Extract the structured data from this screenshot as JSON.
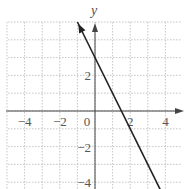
{
  "chart_data": {
    "type": "line",
    "title": "",
    "xlabel": "",
    "ylabel": "y",
    "xlim": [
      -5,
      5
    ],
    "ylim": [
      -5,
      5
    ],
    "grid": true,
    "grid_step": 1,
    "x_ticks": [
      -4,
      -2,
      0,
      2,
      4
    ],
    "y_ticks": [
      -4,
      -2,
      2
    ],
    "x_tick_labels": [
      "−4",
      "−2",
      "0",
      "2",
      "4"
    ],
    "y_tick_labels": [
      "−4",
      "−2",
      "2"
    ],
    "series": [
      {
        "name": "y = -2x + 3",
        "slope": -2,
        "intercept": 3,
        "x": [
          -1,
          3.8
        ],
        "y": [
          5,
          -4.6
        ],
        "arrow_start": true,
        "arrow_end": false,
        "color": "#222222"
      }
    ],
    "key_points": {
      "y_intercept": [
        0,
        3
      ],
      "x_intercept": [
        1.5,
        0
      ]
    }
  },
  "style": {
    "grid_color": "#b8b8b8",
    "axis_color": "#444444",
    "line_color": "#222222"
  }
}
